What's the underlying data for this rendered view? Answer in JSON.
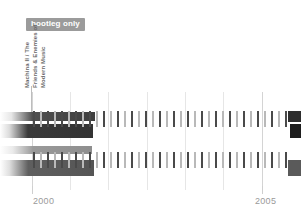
{
  "badge": {
    "label": "bootleg only"
  },
  "album": {
    "line1": "Machina II / The",
    "line2": "Friends & Enemies of",
    "line3": "Modern Music"
  },
  "axis": {
    "years": [
      {
        "label": "2000",
        "x": 33
      },
      {
        "label": "2005",
        "x": 255
      }
    ],
    "tick_positions": [
      32,
      262
    ],
    "gridlines": [
      {
        "x": 32,
        "major": true
      },
      {
        "x": 70,
        "major": false
      },
      {
        "x": 108,
        "major": false
      },
      {
        "x": 147,
        "major": false
      },
      {
        "x": 185,
        "major": false
      },
      {
        "x": 223,
        "major": false
      },
      {
        "x": 262,
        "major": true
      }
    ]
  },
  "colors": {
    "badge_bg": "#9b9b9b",
    "badge_text": "#ffffff",
    "tick": "#6b6b6b",
    "tick_faint": "#b9b9b9",
    "gridline": "#e6e6e6",
    "year_text": "#9a9a9a",
    "label_text": "#6a6a6a",
    "background": "#ffffff"
  },
  "timeline": {
    "upper_ticks": [
      {
        "x": 33,
        "shade": "dark"
      },
      {
        "x": 40,
        "shade": "faint"
      },
      {
        "x": 47,
        "shade": "dark"
      },
      {
        "x": 54,
        "shade": "faint"
      },
      {
        "x": 61,
        "shade": "dark"
      },
      {
        "x": 68,
        "shade": "faint"
      },
      {
        "x": 75,
        "shade": "dark"
      },
      {
        "x": 82,
        "shade": "faint"
      },
      {
        "x": 89,
        "shade": "dark"
      },
      {
        "x": 96,
        "shade": "faint"
      },
      {
        "x": 103,
        "shade": "dark"
      },
      {
        "x": 110,
        "shade": "faint"
      },
      {
        "x": 117,
        "shade": "dark"
      },
      {
        "x": 124,
        "shade": "faint"
      },
      {
        "x": 131,
        "shade": "dark"
      },
      {
        "x": 138,
        "shade": "faint"
      },
      {
        "x": 145,
        "shade": "dark"
      },
      {
        "x": 152,
        "shade": "faint"
      },
      {
        "x": 159,
        "shade": "dark"
      },
      {
        "x": 166,
        "shade": "faint"
      },
      {
        "x": 173,
        "shade": "dark"
      },
      {
        "x": 180,
        "shade": "faint"
      },
      {
        "x": 187,
        "shade": "dark"
      },
      {
        "x": 194,
        "shade": "faint"
      },
      {
        "x": 201,
        "shade": "dark"
      },
      {
        "x": 208,
        "shade": "faint"
      },
      {
        "x": 215,
        "shade": "dark"
      },
      {
        "x": 222,
        "shade": "faint"
      },
      {
        "x": 229,
        "shade": "dark"
      },
      {
        "x": 236,
        "shade": "faint"
      },
      {
        "x": 243,
        "shade": "dark"
      },
      {
        "x": 250,
        "shade": "faint"
      },
      {
        "x": 257,
        "shade": "dark"
      },
      {
        "x": 264,
        "shade": "faint"
      },
      {
        "x": 271,
        "shade": "dark"
      },
      {
        "x": 278,
        "shade": "faint"
      },
      {
        "x": 285,
        "shade": "dark"
      }
    ],
    "lower_ticks": [
      {
        "x": 33,
        "shade": "dark"
      },
      {
        "x": 40,
        "shade": "faint"
      },
      {
        "x": 47,
        "shade": "dark"
      },
      {
        "x": 54,
        "shade": "faint"
      },
      {
        "x": 61,
        "shade": "dark"
      },
      {
        "x": 68,
        "shade": "faint"
      },
      {
        "x": 75,
        "shade": "dark"
      },
      {
        "x": 82,
        "shade": "faint"
      },
      {
        "x": 89,
        "shade": "dark"
      },
      {
        "x": 96,
        "shade": "faint"
      },
      {
        "x": 103,
        "shade": "dark"
      },
      {
        "x": 110,
        "shade": "faint"
      },
      {
        "x": 117,
        "shade": "dark"
      },
      {
        "x": 124,
        "shade": "faint"
      },
      {
        "x": 131,
        "shade": "dark"
      },
      {
        "x": 138,
        "shade": "faint"
      },
      {
        "x": 145,
        "shade": "dark"
      },
      {
        "x": 152,
        "shade": "faint"
      },
      {
        "x": 159,
        "shade": "dark"
      },
      {
        "x": 166,
        "shade": "faint"
      },
      {
        "x": 173,
        "shade": "dark"
      },
      {
        "x": 180,
        "shade": "faint"
      },
      {
        "x": 187,
        "shade": "dark"
      },
      {
        "x": 194,
        "shade": "faint"
      },
      {
        "x": 201,
        "shade": "dark"
      },
      {
        "x": 208,
        "shade": "faint"
      },
      {
        "x": 215,
        "shade": "dark"
      },
      {
        "x": 222,
        "shade": "faint"
      },
      {
        "x": 229,
        "shade": "dark"
      },
      {
        "x": 236,
        "shade": "faint"
      },
      {
        "x": 243,
        "shade": "dark"
      },
      {
        "x": 250,
        "shade": "faint"
      },
      {
        "x": 257,
        "shade": "dark"
      },
      {
        "x": 264,
        "shade": "faint"
      },
      {
        "x": 271,
        "shade": "dark"
      },
      {
        "x": 278,
        "shade": "faint"
      },
      {
        "x": 285,
        "shade": "dark"
      }
    ]
  }
}
